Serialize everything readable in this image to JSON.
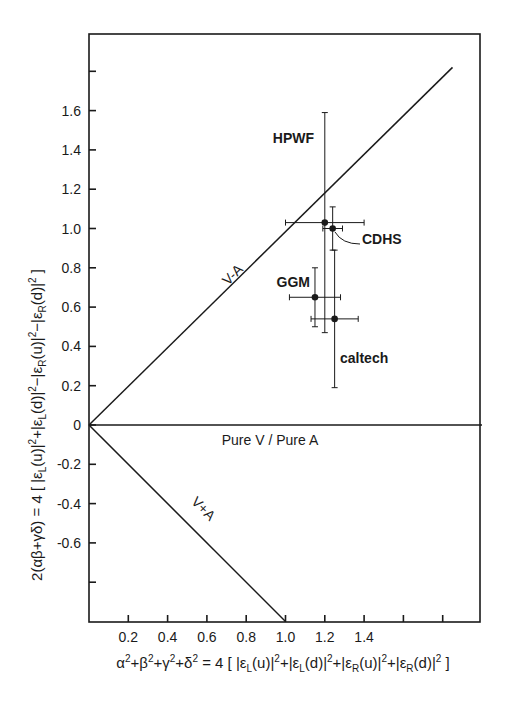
{
  "chart_data": {
    "type": "scatter",
    "title": "",
    "xlabel": "α²+β²+γ²+δ² = 4 [ |ε_L(u)|² + |ε_L(d)|² + |ε_R(u)|² + |ε_R(d)|² ]",
    "ylabel": "2(αβ+γδ) = 4 [ |ε_L(u)|² + |ε_L(d)|² − |ε_R(u)|² − |ε_R(d)|² ]",
    "xlim": [
      0,
      2.0
    ],
    "ylim": [
      -1.0,
      2.0
    ],
    "grid": false,
    "legend": null,
    "x_ticks": [
      0.2,
      0.4,
      0.6,
      0.8,
      1.0,
      1.2,
      1.4,
      1.6,
      1.8
    ],
    "x_tick_labels": [
      "0.2",
      "0.4",
      "0.6",
      "0.8",
      "1.0",
      "1.2",
      "1.4",
      "",
      ""
    ],
    "y_ticks": [
      1.8,
      1.6,
      1.4,
      1.2,
      1.0,
      0.8,
      0.6,
      0.4,
      0.2,
      0,
      -0.2,
      -0.4,
      -0.6,
      -0.8
    ],
    "y_tick_labels": [
      "",
      "1.6",
      "1.4",
      "1.2",
      "1.0",
      "0.8",
      "0.6",
      "0.4",
      "0.2",
      "0",
      "-0.2",
      "-0.4",
      "-0.6",
      ""
    ],
    "reference_lines": [
      {
        "name": "V-A",
        "label": "V-A",
        "x": [
          0,
          1.85
        ],
        "y": [
          0,
          1.82
        ]
      },
      {
        "name": "pure-v-pure-a",
        "label": "Pure V / Pure A",
        "x": [
          0,
          2.0
        ],
        "y": [
          0,
          0
        ]
      },
      {
        "name": "V+A",
        "label": "V+A",
        "x": [
          0,
          1.0
        ],
        "y": [
          0,
          -1.0
        ]
      }
    ],
    "series": [
      {
        "name": "HPWF",
        "x": 1.2,
        "y": 1.03,
        "x_err": [
          1.0,
          1.4
        ],
        "y_err": [
          0.47,
          1.59
        ]
      },
      {
        "name": "CDHS",
        "x": 1.24,
        "y": 1.0,
        "x_err": [
          1.19,
          1.29
        ],
        "y_err": [
          0.89,
          1.11
        ]
      },
      {
        "name": "GGM",
        "x": 1.15,
        "y": 0.65,
        "x_err": [
          1.02,
          1.28
        ],
        "y_err": [
          0.5,
          0.8
        ]
      },
      {
        "name": "caltech",
        "x": 1.25,
        "y": 0.54,
        "x_err": [
          1.13,
          1.37
        ],
        "y_err": [
          0.19,
          0.89
        ]
      }
    ]
  }
}
